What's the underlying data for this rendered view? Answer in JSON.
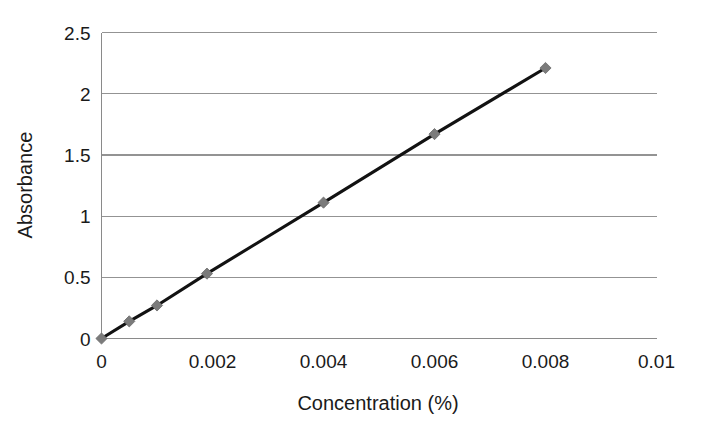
{
  "chart_data": {
    "type": "line",
    "title": "",
    "subtitle": "",
    "xlabel": "Concentration (%)",
    "ylabel": "Absorbance",
    "xlim": [
      0,
      0.01
    ],
    "ylim": [
      0,
      2.5
    ],
    "grid": "horizontal",
    "legend": "none",
    "xticks": [
      0,
      0.002,
      0.004,
      0.006,
      0.008,
      0.01
    ],
    "xtick_labels": [
      "0",
      "0.002",
      "0.004",
      "0.006",
      "0.008",
      "0.01"
    ],
    "yticks": [
      0,
      0.5,
      1,
      1.5,
      2,
      2.5
    ],
    "ytick_labels": [
      "0",
      "0.5",
      "1",
      "1.5",
      "2",
      "2.5"
    ],
    "series": [
      {
        "name": "Calibration curve",
        "marker": "diamond",
        "marker_color": "#7b7b7b",
        "line_color": "#121212",
        "x": [
          0,
          0.0005,
          0.001,
          0.0019,
          0.004,
          0.006,
          0.008
        ],
        "y": [
          0,
          0.14,
          0.27,
          0.53,
          1.11,
          1.67,
          2.21
        ]
      }
    ],
    "annotations": []
  },
  "colors": {
    "background": "#ffffff",
    "gridline": "#939393",
    "axis": "#8a8a8a",
    "line": "#121212",
    "marker": "#7b7b7b",
    "text": "#1a1a1a"
  }
}
